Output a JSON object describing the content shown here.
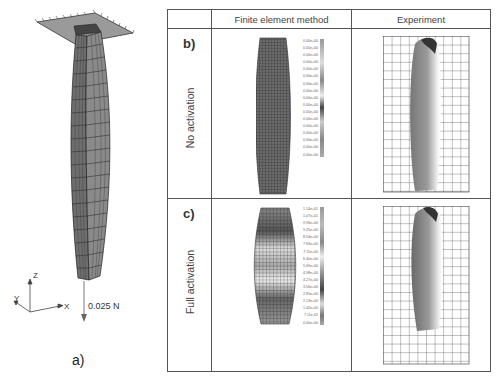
{
  "figure": {
    "panel_a": {
      "label": "a)",
      "force_label": "0.025 N",
      "axes": {
        "x": "X",
        "y": "Y",
        "z": "Z"
      }
    },
    "table": {
      "headers": [
        "",
        "Finite element method",
        "Experiment"
      ],
      "rows": [
        {
          "label": "b)",
          "title": "No activation",
          "legend_values": [
            "0.00e+00",
            "0.00e+00",
            "0.00e+00",
            "0.00e+00",
            "0.00e+00",
            "0.00e+00",
            "0.00e+00",
            "0.00e+00",
            "0.00e+00",
            "0.00e+00",
            "0.00e+00",
            "0.00e+00",
            "0.00e+00",
            "0.00e+00",
            "0.00e+00",
            "0.00e+00",
            "0.00e+00"
          ]
        },
        {
          "label": "c)",
          "title": "Full activation",
          "legend_values": [
            "1.14e+01",
            "1.07e+01",
            "9.96e+00",
            "9.25e+00",
            "8.54e+00",
            "7.83e+00",
            "7.11e+00",
            "6.40e+00",
            "5.69e+00",
            "4.98e+00",
            "4.27e+00",
            "3.56e+00",
            "2.85e+00",
            "2.13e+00",
            "1.42e+00",
            "7.11e-01",
            "0.00e+00"
          ]
        }
      ]
    },
    "colors": {
      "border": "#555555",
      "mesh_fill": "#7a7a7a",
      "mesh_line": "#222222",
      "grid_line": "#333333"
    }
  }
}
